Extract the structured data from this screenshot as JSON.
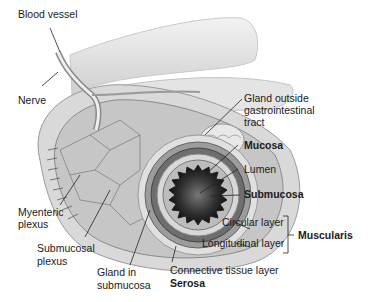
{
  "diagram": {
    "labels": {
      "blood_vessel": "Blood vessel",
      "nerve": "Nerve",
      "gland_outside_1": "Gland outside",
      "gland_outside_2": "gastrointestinal",
      "gland_outside_3": "tract",
      "mucosa": "Mucosa",
      "lumen": "Lumen",
      "submucosa": "Submucosa",
      "circular_layer": "Circular layer",
      "longitudinal_layer": "Longitudinal layer",
      "muscularis": "Muscularis",
      "myenteric_1": "Myenteric",
      "myenteric_2": "plexus",
      "submucosal_1": "Submucosal",
      "submucosal_2": "plexus",
      "gland_in_1": "Gland in",
      "gland_in_2": "submucosa",
      "connective": "Connective tissue layer",
      "serosa": "Serosa"
    },
    "colors": {
      "background": "#ffffff",
      "tissue_light": "#e6e6e6",
      "tissue_mid": "#bdbdbd",
      "tissue_dark": "#555555",
      "lumen": "#2a2a2a",
      "leader_line": "#222222"
    }
  }
}
